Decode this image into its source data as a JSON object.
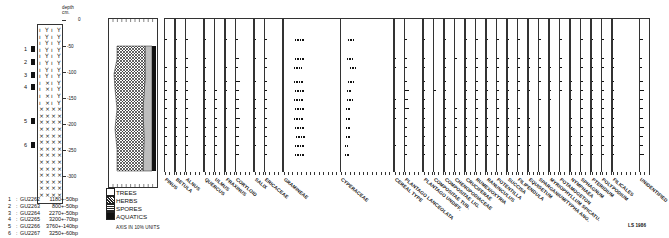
{
  "lithology": {
    "depth_label": "depth\ncm.",
    "depth_ticks": [
      "0",
      "-50",
      "-100",
      "-150",
      "-200",
      "-250",
      "-300"
    ],
    "sample_markers": [
      "1",
      "2",
      "3",
      "4",
      "5",
      "6"
    ]
  },
  "dates": [
    {
      "n": "1",
      "lab": "GU2262",
      "age": "1180+-50bp"
    },
    {
      "n": "2",
      "lab": "GU2263",
      "age": "800+-50bp"
    },
    {
      "n": "3",
      "lab": "GU2264",
      "age": "2270+-50bp"
    },
    {
      "n": "4",
      "lab": "GU2265",
      "age": "3200+-70bp"
    },
    {
      "n": "5",
      "lab": "GU2266",
      "age": "3760+-140bp"
    },
    {
      "n": "6",
      "lab": "GU2267",
      "age": "3250+-60bp"
    }
  ],
  "legend": {
    "items": [
      {
        "label": "TREES",
        "color": "#ffffff"
      },
      {
        "label": "HERBS",
        "color": "#888888"
      },
      {
        "label": "SPORES",
        "color": "#dddddd"
      },
      {
        "label": "AQUATICS",
        "color": "#111111"
      }
    ],
    "axis_note": "AXIS IN 10% UNITS"
  },
  "signature": "LS 1986",
  "chart_data": {
    "type": "pollen-diagram",
    "title": "",
    "xlabel": "AXIS IN 10% UNITS",
    "ylabel": "depth cm.",
    "ylim": [
      0,
      -320
    ],
    "depth_ticks": [
      0,
      -50,
      -100,
      -150,
      -200,
      -250,
      -300
    ],
    "summary_series": [
      "TREES",
      "HERBS",
      "SPORES",
      "AQUATICS"
    ],
    "sample_depths": [
      -40,
      -80,
      -100,
      -130,
      -150,
      -170,
      -190,
      -210,
      -230,
      -250,
      -270,
      -290
    ],
    "taxa": [
      {
        "name": "PINUS",
        "values": [
          1,
          0,
          1,
          1,
          1,
          1,
          1,
          1,
          1,
          1,
          1,
          1
        ]
      },
      {
        "name": "BETULA",
        "values": [
          2,
          2,
          2,
          2,
          3,
          2,
          2,
          2,
          2,
          2,
          2,
          2
        ]
      },
      {
        "name": "ALNUS",
        "values": [
          1,
          1,
          1,
          1,
          1,
          1,
          2,
          1,
          1,
          1,
          2,
          1
        ]
      },
      {
        "name": "QUERCUS",
        "values": [
          2,
          2,
          1,
          2,
          2,
          2,
          2,
          2,
          2,
          2,
          2,
          2
        ]
      },
      {
        "name": "ULMUS",
        "values": [
          0,
          0,
          0,
          0,
          1,
          1,
          1,
          1,
          1,
          1,
          1,
          1
        ]
      },
      {
        "name": "FRAXINUS",
        "values": [
          1,
          0,
          1,
          1,
          1,
          0,
          1,
          0,
          1,
          0,
          0,
          0
        ]
      },
      {
        "name": "CORYLOID",
        "values": [
          2,
          3,
          2,
          4,
          3,
          3,
          3,
          4,
          3,
          3,
          3,
          3
        ]
      },
      {
        "name": "SALIX",
        "values": [
          1,
          2,
          0,
          1,
          0,
          1,
          1,
          1,
          1,
          0,
          1,
          0
        ]
      },
      {
        "name": "ERICACEAE",
        "values": [
          2,
          2,
          2,
          2,
          2,
          2,
          2,
          2,
          2,
          2,
          2,
          2
        ]
      },
      {
        "name": "GRAMINEAE",
        "values": [
          22,
          21,
          19,
          20,
          21,
          20,
          21,
          20,
          21,
          23,
          21,
          22
        ]
      },
      {
        "name": "CYPERACEAE",
        "values": [
          13,
          12,
          17,
          13,
          11,
          12,
          10,
          10,
          10,
          10,
          7,
          8
        ]
      },
      {
        "name": "CEREAL TYPE",
        "values": [
          0,
          1,
          1,
          0,
          0,
          1,
          1,
          1,
          0,
          0,
          1,
          0
        ]
      },
      {
        "name": "PLANTAGO LANCEOLATA",
        "values": [
          2,
          2,
          2,
          2,
          4,
          3,
          4,
          2,
          2,
          2,
          2,
          2
        ]
      },
      {
        "name": "PLANTAGO UNDIFF.",
        "values": [
          1,
          1,
          1,
          2,
          1,
          2,
          1,
          2,
          1,
          1,
          2,
          2
        ]
      },
      {
        "name": "COMPOSITAE TUB.",
        "values": [
          0,
          0,
          0,
          0,
          1,
          0,
          0,
          0,
          0,
          0,
          0,
          0
        ]
      },
      {
        "name": "COMPOSITAE LIG.",
        "values": [
          1,
          2,
          1,
          1,
          2,
          1,
          1,
          1,
          2,
          1,
          1,
          2
        ]
      },
      {
        "name": "CHENOPODIACEAE",
        "values": [
          0,
          1,
          0,
          0,
          0,
          0,
          1,
          1,
          1,
          0,
          0,
          1
        ]
      },
      {
        "name": "CRUCIFERAE",
        "values": [
          1,
          1,
          1,
          1,
          1,
          1,
          1,
          1,
          1,
          1,
          1,
          1
        ]
      },
      {
        "name": "RUMEX/OXYRIA",
        "values": [
          1,
          2,
          1,
          1,
          1,
          2,
          1,
          2,
          1,
          1,
          1,
          1
        ]
      },
      {
        "name": "RANUNCULUS",
        "values": [
          1,
          1,
          1,
          1,
          1,
          1,
          1,
          1,
          1,
          1,
          1,
          1
        ]
      },
      {
        "name": "POTENTILLA",
        "values": [
          1,
          1,
          1,
          1,
          1,
          1,
          1,
          1,
          1,
          1,
          1,
          1
        ]
      },
      {
        "name": "SUCCISA",
        "values": [
          1,
          1,
          1,
          1,
          1,
          1,
          1,
          1,
          1,
          1,
          1,
          1
        ]
      },
      {
        "name": "FILIPENDULA",
        "values": [
          1,
          1,
          1,
          1,
          1,
          0,
          1,
          1,
          1,
          1,
          1,
          1
        ]
      },
      {
        "name": "EQUISETUM",
        "values": [
          0,
          1,
          1,
          1,
          1,
          0,
          0,
          1,
          1,
          0,
          1,
          0
        ]
      },
      {
        "name": "SPARGANIUM/TYPHA ANG.",
        "values": [
          2,
          1,
          1,
          1,
          0,
          1,
          0,
          0,
          1,
          0,
          1,
          0
        ]
      },
      {
        "name": "MYRIOPHYLLUM SPICATU.",
        "values": [
          0,
          0,
          1,
          1,
          1,
          1,
          0,
          0,
          1,
          0,
          0,
          0
        ]
      },
      {
        "name": "POTAMOGETON",
        "values": [
          1,
          1,
          1,
          1,
          1,
          0,
          0,
          0,
          0,
          0,
          0,
          0
        ]
      },
      {
        "name": "NYMPHAEA",
        "values": [
          0,
          0,
          0,
          1,
          1,
          1,
          0,
          1,
          1,
          1,
          1,
          1
        ]
      },
      {
        "name": "SPHAGNUM",
        "values": [
          2,
          2,
          1,
          2,
          1,
          1,
          1,
          1,
          1,
          1,
          1,
          1
        ]
      },
      {
        "name": "PTERIDIUM",
        "values": [
          1,
          2,
          2,
          2,
          2,
          2,
          2,
          2,
          2,
          2,
          1,
          2
        ]
      },
      {
        "name": "POLYPODIUM",
        "values": [
          1,
          1,
          1,
          1,
          1,
          1,
          1,
          1,
          1,
          2,
          2,
          1
        ]
      },
      {
        "name": "FILICALES",
        "values": [
          1,
          1,
          1,
          1,
          1,
          1,
          1,
          1,
          1,
          1,
          1,
          1
        ]
      },
      {
        "name": "UNIDENTIFIED",
        "values": [
          3,
          2,
          2,
          3,
          4,
          3,
          3,
          3,
          4,
          3,
          3,
          4
        ]
      }
    ]
  }
}
